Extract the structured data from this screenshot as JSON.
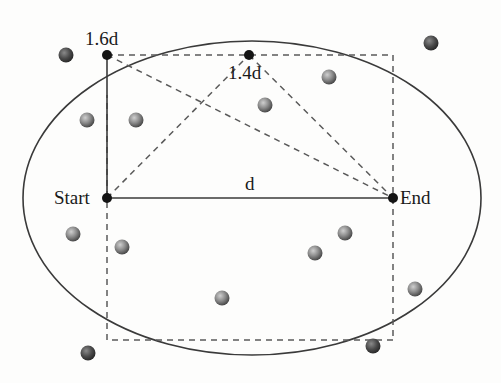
{
  "diagram": {
    "labels": {
      "start": "Start",
      "end": "End",
      "d": "d",
      "p16": "1.6d",
      "p14": "1.4d"
    },
    "points": {
      "start": [
        107,
        198
      ],
      "end": [
        393,
        198
      ],
      "p16": [
        107,
        55
      ],
      "p14": [
        249,
        55
      ]
    },
    "ellipse": {
      "cx": 252,
      "cy": 198,
      "rx": 229,
      "ry": 157
    },
    "dashed_rect": {
      "x": 107,
      "y": 55,
      "w": 286,
      "h": 285
    },
    "balls": [
      [
        66,
        55
      ],
      [
        431,
        43
      ],
      [
        87,
        120
      ],
      [
        136,
        120
      ],
      [
        265,
        105
      ],
      [
        329,
        77
      ],
      [
        73,
        234
      ],
      [
        122,
        247
      ],
      [
        345,
        233
      ],
      [
        315,
        253
      ],
      [
        222,
        298
      ],
      [
        415,
        289
      ],
      [
        88,
        353
      ],
      [
        373,
        346
      ]
    ],
    "colors": {
      "line": "#3a3a3a",
      "dash": "#5a5a5a",
      "point": "#141414",
      "ball_light": "#b8b8b8",
      "ball_dark": "#4a4a4a"
    }
  }
}
